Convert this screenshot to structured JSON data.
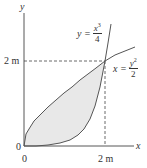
{
  "diagram": {
    "axes": {
      "x_label": "x",
      "y_label": "y",
      "origin_x_tick": "0",
      "origin_y_tick": "0",
      "x_tick": "2 m",
      "y_tick": "2 m"
    },
    "curves": [
      {
        "name": "cubic",
        "lhs": "y =",
        "num_base": "x",
        "num_exp": "3",
        "den": "4"
      },
      {
        "name": "parabola",
        "lhs": "x =",
        "num_base": "y",
        "num_exp": "2",
        "den": "2"
      }
    ],
    "intersection": {
      "x": 2,
      "y": 2
    },
    "colors": {
      "curve": "#555555",
      "fill": "#e6e6e6",
      "axis": "#444444",
      "dashed": "#444444"
    }
  }
}
